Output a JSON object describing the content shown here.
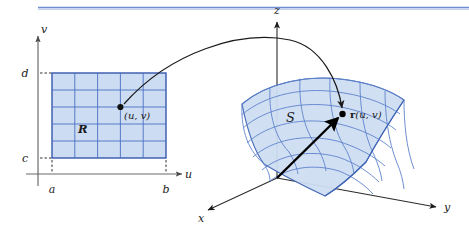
{
  "figure": {
    "background_color": "#ffffff",
    "top_rule_color": "#6f8dd0"
  },
  "uv_plane": {
    "name": "uv-parameter-plane",
    "vertical_axis_label": "v",
    "horizontal_axis_label": "u",
    "tick_labels": {
      "top_v": "d",
      "bottom_v": "c",
      "left_u": "a",
      "right_u": "b"
    },
    "region_label": "R",
    "point_label": "(u, v)",
    "grid": {
      "columns": 5,
      "rows": 5,
      "fill_color": "#ccdcf2",
      "line_color": "#4a6fc4",
      "border_color": "#3558ad"
    },
    "axis_color": "#6b6b6b",
    "dashed_guide_color": "#333333"
  },
  "xyz_space": {
    "name": "xyz-coordinate-space",
    "axis_labels": {
      "z": "z",
      "x": "x",
      "y": "y"
    },
    "axis_color": "#2b2b2b",
    "surface_label": "S",
    "vector_label_bold": "r",
    "vector_label_args": "(u, v)",
    "surface": {
      "fill_color": "#cfdef3",
      "line_color": "#5d82cc",
      "edge_color": "#3f65b5",
      "u_lines": 6,
      "v_lines": 7
    },
    "position_vector_color": "#000000",
    "point_marker_color": "#000000"
  },
  "mapping_arrow": {
    "name": "mapping-arrow",
    "description": "curved arrow from (u, v) in R to r(u, v) on S",
    "color": "#1a1a1a"
  }
}
